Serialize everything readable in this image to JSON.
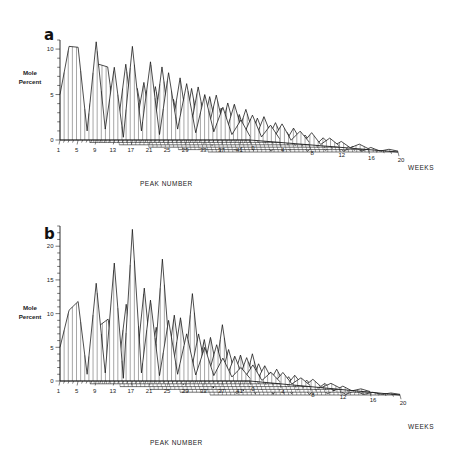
{
  "figure": {
    "panels": [
      {
        "id": "a",
        "letter": "a",
        "ylabel_line1": "Mole",
        "ylabel_line2": "Percent",
        "xlabel": "PEAK NUMBER",
        "zlabel": "WEEKS",
        "y_ticks": [
          "0",
          "5",
          "10"
        ],
        "x_ticks": [
          "1",
          "5",
          "9",
          "13",
          "17",
          "21",
          "25",
          "29",
          "33",
          "37",
          "41"
        ],
        "z_ticks": [
          "0",
          "4",
          "8",
          "12",
          "16",
          "20"
        ]
      },
      {
        "id": "b",
        "letter": "b",
        "ylabel_line1": "Mole",
        "ylabel_line2": "Percent",
        "xlabel": "PEAK NUMBER",
        "zlabel": "WEEKS",
        "y_ticks": [
          "0",
          "5",
          "10",
          "15",
          "20"
        ],
        "x_ticks": [
          "1",
          "5",
          "9",
          "13",
          "17",
          "21",
          "25",
          "29",
          "33",
          "37",
          "41"
        ],
        "z_ticks": [
          "0",
          "4",
          "8",
          "12",
          "16",
          "20"
        ]
      }
    ]
  },
  "chart_data": [
    {
      "type": "line",
      "title": "a",
      "subtitle": "",
      "xlabel": "PEAK NUMBER",
      "ylabel": "Mole Percent",
      "zlabel": "WEEKS",
      "projection": "3d-waterfall",
      "grid": false,
      "legend": "none",
      "xlim": [
        1,
        43
      ],
      "ylim": [
        0,
        11
      ],
      "zlim": [
        0,
        20
      ],
      "x_tick_labels": [
        "1",
        "5",
        "9",
        "13",
        "17",
        "21",
        "25",
        "29",
        "33",
        "37",
        "41"
      ],
      "x_tick_values": [
        1,
        5,
        9,
        13,
        17,
        21,
        25,
        29,
        33,
        37,
        41
      ],
      "y_tick_labels": [
        "0",
        "5",
        "10"
      ],
      "y_tick_values": [
        0,
        5,
        10
      ],
      "z_tick_labels": [
        "0",
        "4",
        "8",
        "12",
        "16",
        "20"
      ],
      "z_tick_values": [
        0,
        4,
        8,
        12,
        16,
        20
      ],
      "x": [
        1,
        3,
        5,
        7,
        9,
        11,
        13,
        15,
        17,
        19,
        21,
        23,
        25,
        27,
        29,
        31,
        33,
        35,
        37,
        39,
        41,
        43
      ],
      "series": [
        {
          "name": "0 weeks",
          "z": 0,
          "values": [
            5.0,
            10.3,
            10.2,
            1.0,
            10.8,
            1.2,
            8.0,
            0.3,
            10.3,
            1.0,
            8.6,
            0.6,
            7.4,
            1.2,
            6.2,
            0.8,
            5.0,
            0.9,
            3.6,
            0.6,
            2.2,
            0.4
          ]
        },
        {
          "name": "4 weeks",
          "z": 4,
          "values": [
            3.9,
            8.6,
            8.3,
            0.9,
            8.6,
            1.0,
            6.6,
            0.4,
            8.3,
            0.9,
            7.1,
            0.6,
            6.1,
            1.0,
            5.2,
            0.8,
            4.2,
            0.8,
            3.0,
            0.6,
            1.9,
            0.4
          ]
        },
        {
          "name": "8 weeks",
          "z": 8,
          "values": [
            2.9,
            6.4,
            6.2,
            0.7,
            6.4,
            0.8,
            5.0,
            0.3,
            6.2,
            0.7,
            5.3,
            0.5,
            4.6,
            0.8,
            3.9,
            0.6,
            3.1,
            0.6,
            2.3,
            0.5,
            1.5,
            0.3
          ]
        },
        {
          "name": "12 weeks",
          "z": 12,
          "values": [
            2.0,
            4.4,
            4.3,
            0.5,
            4.4,
            0.6,
            3.4,
            0.2,
            4.3,
            0.5,
            3.6,
            0.4,
            3.2,
            0.6,
            2.7,
            0.4,
            2.1,
            0.4,
            1.6,
            0.3,
            1.0,
            0.2
          ]
        },
        {
          "name": "16 weeks",
          "z": 16,
          "values": [
            1.2,
            2.6,
            2.5,
            0.3,
            2.6,
            0.4,
            2.0,
            0.2,
            2.5,
            0.3,
            2.1,
            0.3,
            1.9,
            0.4,
            1.6,
            0.3,
            1.3,
            0.3,
            0.9,
            0.2,
            0.6,
            0.1
          ]
        },
        {
          "name": "20 weeks",
          "z": 20,
          "values": [
            0.6,
            1.3,
            1.2,
            0.2,
            1.3,
            0.2,
            1.0,
            0.1,
            1.2,
            0.2,
            1.0,
            0.1,
            0.9,
            0.2,
            0.8,
            0.1,
            0.6,
            0.1,
            0.5,
            0.1,
            0.3,
            0.1
          ]
        }
      ]
    },
    {
      "type": "line",
      "title": "b",
      "subtitle": "",
      "xlabel": "PEAK NUMBER",
      "ylabel": "Mole Percent",
      "zlabel": "WEEKS",
      "projection": "3d-waterfall",
      "grid": false,
      "legend": "none",
      "xlim": [
        1,
        43
      ],
      "ylim": [
        0,
        23
      ],
      "zlim": [
        0,
        20
      ],
      "x_tick_labels": [
        "1",
        "5",
        "9",
        "13",
        "17",
        "21",
        "25",
        "29",
        "33",
        "37",
        "41"
      ],
      "x_tick_values": [
        1,
        5,
        9,
        13,
        17,
        21,
        25,
        29,
        33,
        37,
        41
      ],
      "y_tick_labels": [
        "0",
        "5",
        "10",
        "15",
        "20"
      ],
      "y_tick_values": [
        0,
        5,
        10,
        15,
        20
      ],
      "z_tick_labels": [
        "0",
        "4",
        "8",
        "12",
        "16",
        "20"
      ],
      "z_tick_values": [
        0,
        4,
        8,
        12,
        16,
        20
      ],
      "x": [
        1,
        3,
        5,
        7,
        9,
        11,
        13,
        15,
        17,
        19,
        21,
        23,
        25,
        27,
        29,
        31,
        33,
        35,
        37,
        39,
        41,
        43
      ],
      "series": [
        {
          "name": "0 weeks",
          "z": 0,
          "values": [
            5.0,
            10.5,
            11.8,
            1.0,
            14.5,
            1.2,
            17.5,
            0.4,
            22.5,
            1.2,
            12.0,
            0.8,
            9.0,
            1.0,
            7.0,
            0.9,
            5.0,
            0.8,
            3.4,
            0.6,
            2.0,
            0.4
          ]
        },
        {
          "name": "4 weeks",
          "z": 4,
          "values": [
            4.2,
            8.6,
            9.6,
            0.9,
            11.8,
            1.0,
            14.2,
            0.4,
            18.5,
            1.0,
            9.8,
            0.7,
            7.4,
            0.9,
            5.8,
            0.7,
            4.1,
            0.7,
            2.8,
            0.5,
            1.7,
            0.3
          ]
        },
        {
          "name": "8 weeks",
          "z": 8,
          "values": [
            3.2,
            6.4,
            7.2,
            0.7,
            8.8,
            0.8,
            10.6,
            0.3,
            13.8,
            0.8,
            7.3,
            0.5,
            5.5,
            0.7,
            4.3,
            0.6,
            3.1,
            0.5,
            2.1,
            0.4,
            1.3,
            0.2
          ]
        },
        {
          "name": "12 weeks",
          "z": 12,
          "values": [
            2.3,
            4.4,
            5.0,
            0.5,
            6.1,
            0.6,
            7.4,
            0.2,
            9.6,
            0.6,
            5.1,
            0.4,
            3.8,
            0.5,
            3.0,
            0.4,
            2.1,
            0.4,
            1.5,
            0.3,
            0.9,
            0.2
          ]
        },
        {
          "name": "16 weeks",
          "z": 16,
          "values": [
            1.4,
            2.6,
            3.0,
            0.3,
            3.6,
            0.4,
            4.4,
            0.2,
            5.7,
            0.4,
            3.0,
            0.3,
            2.3,
            0.3,
            1.8,
            0.3,
            1.3,
            0.2,
            0.9,
            0.2,
            0.5,
            0.1
          ]
        },
        {
          "name": "20 weeks",
          "z": 20,
          "values": [
            0.7,
            1.3,
            1.5,
            0.2,
            1.8,
            0.2,
            2.2,
            0.1,
            2.9,
            0.2,
            1.5,
            0.1,
            1.2,
            0.2,
            0.9,
            0.1,
            0.6,
            0.1,
            0.4,
            0.1,
            0.3,
            0.1
          ]
        }
      ]
    }
  ]
}
